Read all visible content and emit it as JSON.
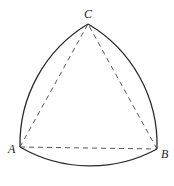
{
  "diagram": {
    "type": "reuleaux-triangle",
    "vertices": {
      "A": {
        "label": "A",
        "x": 20,
        "y": 147
      },
      "B": {
        "label": "B",
        "x": 157,
        "y": 149
      },
      "C": {
        "label": "C",
        "x": 88,
        "y": 24
      }
    },
    "arc_color": "#2a2a2a",
    "dash_color": "#444444"
  }
}
